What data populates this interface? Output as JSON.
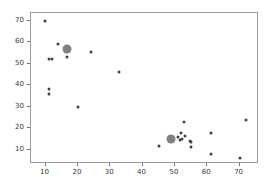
{
  "figure": {
    "background_color": "#ffffff",
    "axes_color": "#9a9a9a",
    "tick_label_color": "#3a3a3a",
    "title": "",
    "x_axis_label": "",
    "y_axis_label": ""
  },
  "chart_data": {
    "type": "scatter",
    "title": "",
    "xlabel": "",
    "ylabel": "",
    "xlim": [
      5.5,
      76.0
    ],
    "ylim": [
      3.5,
      73.5
    ],
    "xticks": [
      10,
      20,
      30,
      40,
      50,
      60,
      70
    ],
    "yticks": [
      10,
      20,
      30,
      40,
      50,
      60,
      70
    ],
    "xticklabels": [
      "10",
      "20",
      "30",
      "40",
      "50",
      "60",
      "70"
    ],
    "yticklabels": [
      "10",
      "20",
      "30",
      "40",
      "50",
      "60",
      "70"
    ],
    "grid": false,
    "legend": null,
    "series": [
      {
        "name": "data-points",
        "marker": "circle",
        "color": "#404040",
        "size": 3,
        "x": [
          9.8,
          11.0,
          11.1,
          11.1,
          12.0,
          14.0,
          16.5,
          20.0,
          24.0,
          32.8,
          45.2,
          49.5,
          50.8,
          51.5,
          52.0,
          52.3,
          52.8,
          53.0,
          54.8,
          55.0,
          55.0,
          61.2,
          61.3,
          70.2,
          72.0
        ],
        "y": [
          70.0,
          38.5,
          36.0,
          52.0,
          52.0,
          59.0,
          53.0,
          30.0,
          55.2,
          46.0,
          12.0,
          14.2,
          16.0,
          14.8,
          18.0,
          15.0,
          23.0,
          16.5,
          14.0,
          13.8,
          11.2,
          8.0,
          18.0,
          6.5,
          23.8
        ]
      },
      {
        "name": "cluster-centroids",
        "marker": "circle",
        "color": "#808080",
        "size": 9,
        "x": [
          16.6,
          48.7
        ],
        "y": [
          57.0,
          15.0
        ]
      }
    ]
  }
}
